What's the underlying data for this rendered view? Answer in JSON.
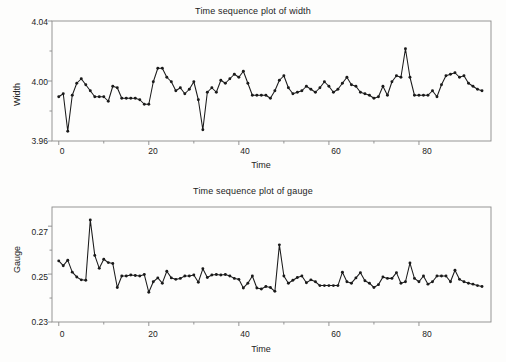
{
  "figure": {
    "background": "#fdfdfc",
    "ink": "#1a1a1a",
    "frame_color": "#8a8a8a"
  },
  "charts": [
    {
      "id": "width",
      "title": "Time sequence plot of width",
      "ylabel": "Width",
      "xlabel": "Time",
      "yticks": [
        "3.96",
        "4.00",
        "4.04"
      ],
      "xticks": [
        "0",
        "20",
        "40",
        "60",
        "80"
      ]
    },
    {
      "id": "gauge",
      "title": "Time sequence plot of gauge",
      "ylabel": "Gauge",
      "xlabel": "Time",
      "yticks": [
        "0.23",
        "0.25",
        "0.27"
      ],
      "xticks": [
        "0",
        "20",
        "40",
        "60",
        "80"
      ]
    }
  ],
  "chart_data": [
    {
      "type": "line",
      "id": "width",
      "title": "Time sequence plot of width",
      "xlabel": "Time",
      "ylabel": "Width",
      "xlim": [
        -1.5,
        96
      ],
      "ylim": [
        3.96,
        4.04
      ],
      "xticks": [
        0,
        20,
        40,
        60,
        80
      ],
      "yticks": [
        3.96,
        4.0,
        4.04
      ],
      "grid": false,
      "legend": null,
      "markers": "filled-circle",
      "x": [
        0,
        1,
        2,
        3,
        4,
        5,
        6,
        7,
        8,
        9,
        10,
        11,
        12,
        13,
        14,
        15,
        16,
        17,
        18,
        19,
        20,
        21,
        22,
        23,
        24,
        25,
        26,
        27,
        28,
        29,
        30,
        31,
        32,
        33,
        34,
        35,
        36,
        37,
        38,
        39,
        40,
        41,
        42,
        43,
        44,
        45,
        46,
        47,
        48,
        49,
        50,
        51,
        52,
        53,
        54,
        55,
        56,
        57,
        58,
        59,
        60,
        61,
        62,
        63,
        64,
        65,
        66,
        67,
        68,
        69,
        70,
        71,
        72,
        73,
        74,
        75,
        76,
        77,
        78,
        79,
        80,
        81,
        82,
        83,
        84,
        85,
        86,
        87,
        88,
        89,
        90,
        91,
        92,
        93,
        94
      ],
      "y": [
        3.9895,
        3.9915,
        3.9665,
        3.9905,
        3.9985,
        4.0015,
        3.9975,
        3.9935,
        3.9895,
        3.9895,
        3.9895,
        3.9865,
        3.9965,
        3.9955,
        3.9885,
        3.9885,
        3.9885,
        3.9885,
        3.9875,
        3.9845,
        3.9845,
        3.9995,
        4.0085,
        4.0085,
        4.0025,
        3.9995,
        3.9935,
        3.9955,
        3.9915,
        3.9945,
        3.9995,
        3.9875,
        3.9675,
        3.9925,
        3.9955,
        3.9925,
        4.0005,
        3.9985,
        4.0015,
        4.0045,
        4.0025,
        4.0065,
        3.9985,
        3.9905,
        3.9905,
        3.9905,
        3.9905,
        3.9885,
        3.9935,
        4.0005,
        4.0035,
        3.9955,
        3.9915,
        3.9925,
        3.9935,
        3.9965,
        3.9945,
        3.9925,
        3.9955,
        3.9995,
        3.9965,
        3.9925,
        3.9945,
        3.9985,
        4.0025,
        3.9975,
        3.9965,
        3.9925,
        3.9915,
        3.9905,
        3.9885,
        3.9895,
        3.9965,
        3.9905,
        3.9995,
        4.0035,
        4.0025,
        4.0215,
        4.0025,
        3.9905,
        3.9905,
        3.9905,
        3.9905,
        3.9935,
        3.9895,
        3.9975,
        4.0035,
        4.0045,
        4.0055,
        4.0025,
        4.0035,
        3.9985,
        3.9965,
        3.9945,
        3.9935
      ]
    },
    {
      "type": "line",
      "id": "gauge",
      "title": "Time sequence plot of gauge",
      "xlabel": "Time",
      "ylabel": "Gauge",
      "xlim": [
        -1.5,
        96
      ],
      "ylim": [
        0.23,
        0.278
      ],
      "xticks": [
        0,
        20,
        40,
        60,
        80
      ],
      "yticks": [
        0.23,
        0.25,
        0.27
      ],
      "grid": false,
      "legend": null,
      "markers": "filled-circle",
      "x": [
        0,
        1,
        2,
        3,
        4,
        5,
        6,
        7,
        8,
        9,
        10,
        11,
        12,
        13,
        14,
        15,
        16,
        17,
        18,
        19,
        20,
        21,
        22,
        23,
        24,
        25,
        26,
        27,
        28,
        29,
        30,
        31,
        32,
        33,
        34,
        35,
        36,
        37,
        38,
        39,
        40,
        41,
        42,
        43,
        44,
        45,
        46,
        47,
        48,
        49,
        50,
        51,
        52,
        53,
        54,
        55,
        56,
        57,
        58,
        59,
        60,
        61,
        62,
        63,
        64,
        65,
        66,
        67,
        68,
        69,
        70,
        71,
        72,
        73,
        74,
        75,
        76,
        77,
        78,
        79,
        80,
        81,
        82,
        83,
        84,
        85,
        86,
        87,
        88,
        89,
        90,
        91,
        92,
        93,
        94
      ],
      "y": [
        0.2555,
        0.2535,
        0.2558,
        0.2508,
        0.2488,
        0.2476,
        0.2474,
        0.2726,
        0.2578,
        0.2524,
        0.2562,
        0.2548,
        0.2544,
        0.2444,
        0.2492,
        0.2492,
        0.2496,
        0.2494,
        0.2492,
        0.2498,
        0.2424,
        0.2468,
        0.2484,
        0.2462,
        0.2512,
        0.2484,
        0.2478,
        0.2482,
        0.2492,
        0.2492,
        0.2496,
        0.2466,
        0.2522,
        0.2486,
        0.2496,
        0.2498,
        0.2496,
        0.2498,
        0.2492,
        0.2482,
        0.2478,
        0.2442,
        0.2462,
        0.2492,
        0.2442,
        0.2438,
        0.2448,
        0.2444,
        0.2428,
        0.2622,
        0.2492,
        0.2462,
        0.2474,
        0.2486,
        0.2492,
        0.2464,
        0.2476,
        0.2468,
        0.2452,
        0.2452,
        0.2452,
        0.2452,
        0.2452,
        0.2508,
        0.2468,
        0.2462,
        0.2484,
        0.2506,
        0.2472,
        0.2462,
        0.2444,
        0.2456,
        0.2488,
        0.2482,
        0.2482,
        0.2506,
        0.2462,
        0.2468,
        0.2546,
        0.2482,
        0.2468,
        0.2492,
        0.2458,
        0.2468,
        0.2492,
        0.2492,
        0.2492,
        0.2468,
        0.2516,
        0.2478,
        0.2468,
        0.2462,
        0.2458,
        0.2452,
        0.2448
      ]
    }
  ]
}
